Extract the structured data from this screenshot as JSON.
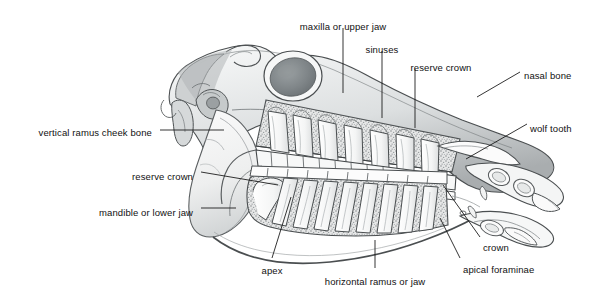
{
  "figure": {
    "background_color": "#ffffff",
    "ink_color": "#111111",
    "drawing_style": "graphite pencil shaded line drawing",
    "width": 599,
    "height": 295
  },
  "labels": [
    {
      "id": "maxilla",
      "text": "maxilla or upper jaw",
      "text_x": 343,
      "text_y": 22,
      "anchor": "center",
      "leader": {
        "type": "line",
        "x1": 343,
        "y1": 28,
        "x2": 343,
        "y2": 93
      }
    },
    {
      "id": "sinuses",
      "text": "sinuses",
      "text_x": 382,
      "text_y": 45,
      "anchor": "center",
      "leader": {
        "type": "line",
        "x1": 382,
        "y1": 51,
        "x2": 382,
        "y2": 118
      }
    },
    {
      "id": "reserve-crown-upper",
      "text": "reserve crown",
      "text_x": 441,
      "text_y": 63,
      "anchor": "center",
      "leader": {
        "type": "line",
        "x1": 415,
        "y1": 69,
        "x2": 415,
        "y2": 128
      }
    },
    {
      "id": "nasal-bone",
      "text": "nasal bone",
      "text_x": 524,
      "text_y": 71,
      "anchor": "left",
      "leader": {
        "type": "line",
        "x1": 520,
        "y1": 72,
        "x2": 477,
        "y2": 97
      }
    },
    {
      "id": "wolf-tooth",
      "text": "wolf tooth",
      "text_x": 530,
      "text_y": 124,
      "anchor": "left",
      "leader": {
        "type": "line",
        "x1": 527,
        "y1": 124,
        "x2": 466,
        "y2": 159
      }
    },
    {
      "id": "vertical-ramus",
      "text": "vertical ramus cheek bone",
      "text_x": 152,
      "text_y": 128,
      "anchor": "right",
      "leader": {
        "type": "line",
        "x1": 160,
        "y1": 130,
        "x2": 224,
        "y2": 130
      }
    },
    {
      "id": "reserve-crown-lower",
      "text": "reserve crown",
      "text_x": 193,
      "text_y": 172,
      "anchor": "right",
      "leader": {
        "type": "line",
        "x1": 201,
        "y1": 172,
        "x2": 278,
        "y2": 185
      }
    },
    {
      "id": "mandible",
      "text": "mandible or lower jaw",
      "text_x": 193,
      "text_y": 208,
      "anchor": "right",
      "leader": {
        "type": "line",
        "x1": 201,
        "y1": 208,
        "x2": 236,
        "y2": 208
      }
    },
    {
      "id": "apex",
      "text": "apex",
      "text_x": 272,
      "text_y": 266,
      "anchor": "center",
      "leader": {
        "type": "line",
        "x1": 272,
        "y1": 258,
        "x2": 291,
        "y2": 197
      }
    },
    {
      "id": "horizontal-ramus",
      "text": "horizontal ramus or jaw",
      "text_x": 375,
      "text_y": 277,
      "anchor": "center",
      "leader": {
        "type": "line",
        "x1": 375,
        "y1": 268,
        "x2": 375,
        "y2": 240
      }
    },
    {
      "id": "apical-foraminae",
      "text": "apical foraminae",
      "text_x": 463,
      "text_y": 265,
      "anchor": "left",
      "leader": {
        "type": "line",
        "x1": 460,
        "y1": 258,
        "x2": 440,
        "y2": 218
      }
    },
    {
      "id": "crown",
      "text": "crown",
      "text_x": 483,
      "text_y": 243,
      "anchor": "left",
      "leader": {
        "type": "line",
        "x1": 480,
        "y1": 237,
        "x2": 443,
        "y2": 185
      }
    }
  ]
}
